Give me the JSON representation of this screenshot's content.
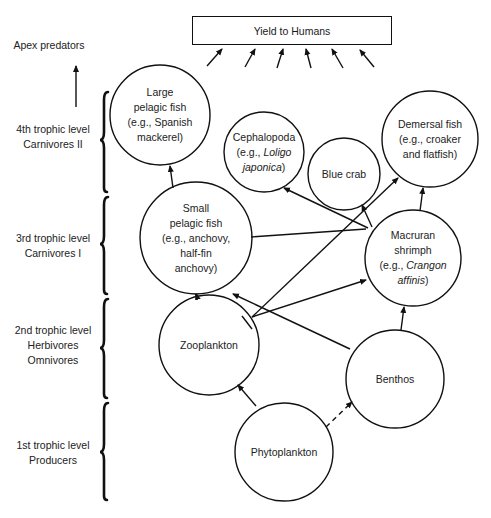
{
  "yield_box": {
    "label": "Yield to Humans"
  },
  "apex": {
    "label": "Apex predators"
  },
  "levels": [
    {
      "line1": "4th trophic level",
      "line2": "Carnivores II",
      "line3": ""
    },
    {
      "line1": "3rd trophic level",
      "line2": "Carnivores I",
      "line3": ""
    },
    {
      "line1": "2nd trophic level",
      "line2": "Herbivores",
      "line3": "Omnivores"
    },
    {
      "line1": "1st trophic level",
      "line2": "Producers",
      "line3": ""
    }
  ],
  "nodes": {
    "large_pelagic": {
      "l1": "Large",
      "l2": "pelagic fish",
      "l3": "(e.g., Spanish",
      "l4": "mackerel)"
    },
    "cephalopoda": {
      "l1": "Cephalopoda",
      "l2a": "(e.g., ",
      "l2b": "Loligo",
      "l3a": "japonica",
      "l3b": ")"
    },
    "blue_crab": {
      "l1": "Blue crab"
    },
    "demersal": {
      "l1": "Demersal fish",
      "l2": "(e.g., croaker",
      "l3": "and flatfish)"
    },
    "small_pelagic": {
      "l1": "Small",
      "l2": "pelagic fish",
      "l3": "(e.g., anchovy,",
      "l4": "half-fin",
      "l5": "anchovy)"
    },
    "macruran": {
      "l1": "Macruran",
      "l2": "shrimph",
      "l3a": "(e.g., ",
      "l3b": "Crangon",
      "l4a": "affinis",
      "l4b": ")"
    },
    "zooplankton": {
      "l1": "Zooplankton"
    },
    "benthos": {
      "l1": "Benthos"
    },
    "phytoplankton": {
      "l1": "Phytoplankton"
    }
  },
  "colors": {
    "line": "#111111",
    "background": "#ffffff"
  }
}
